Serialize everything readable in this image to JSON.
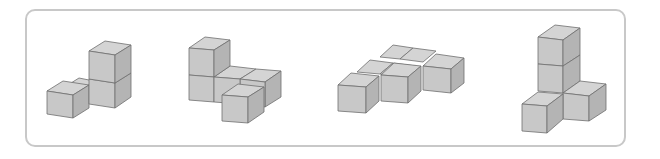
{
  "diagram": {
    "type": "isometric-cube-figures",
    "colors": {
      "frame_border": "#c8c8c8",
      "cube_top": "#d4d4d4",
      "cube_front": "#c8c8c8",
      "cube_side": "#b4b4b4",
      "edge": "#6e6e6e"
    },
    "figures": [
      {
        "index": 1,
        "cube_count": 4,
        "description": "2-high column with one cube to the left and one behind-left"
      },
      {
        "index": 2,
        "cube_count": 5,
        "description": "2-high column at left with L-shaped base of 4 cubes"
      },
      {
        "index": 3,
        "cube_count": 6,
        "description": "flat staircase layer of 6 cubes"
      },
      {
        "index": 4,
        "cube_count": 5,
        "description": "3-high column with one cube left and one cube right at base"
      }
    ]
  }
}
